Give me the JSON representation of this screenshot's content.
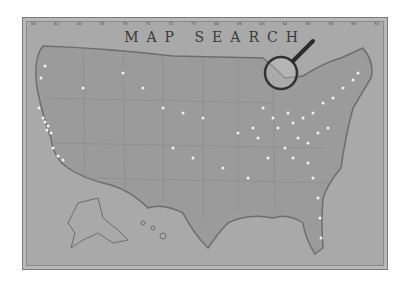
{
  "title": "MAP SEARCH",
  "top_ticks": [
    "84",
    "82",
    "80",
    "78",
    "76",
    "74",
    "72",
    "70",
    "68",
    "66",
    "64",
    "62",
    "60",
    "58",
    "56",
    "54"
  ],
  "colors": {
    "background": "#a9a9a9",
    "land": "#9e9e9e",
    "border": "#6e6e6e",
    "pins": "#f2f2f2"
  },
  "icons": {
    "magnifier": "magnifying-glass-icon"
  }
}
